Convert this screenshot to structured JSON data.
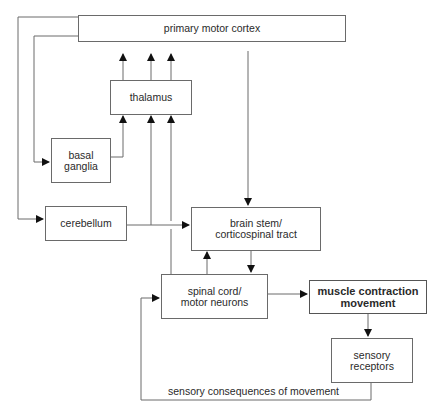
{
  "diagram": {
    "nodes": {
      "cortex": {
        "label": "primary motor cortex"
      },
      "thalamus": {
        "label": "thalamus"
      },
      "basal_ganglia": {
        "line1": "basal",
        "line2": "ganglia"
      },
      "cerebellum": {
        "label": "cerebellum"
      },
      "brainstem": {
        "line1": "brain stem/",
        "line2": "corticospinal tract"
      },
      "spinal": {
        "line1": "spinal cord/",
        "line2": "motor neurons"
      },
      "muscle": {
        "line1": "muscle contraction",
        "line2": "movement"
      },
      "sensory": {
        "line1": "sensory",
        "line2": "receptors"
      }
    },
    "edge_labels": {
      "feedback": "sensory consequences of movement"
    },
    "edges": [
      {
        "from": "cortex",
        "to": "basal_ganglia"
      },
      {
        "from": "cortex",
        "to": "cerebellum"
      },
      {
        "from": "cortex",
        "to": "brainstem"
      },
      {
        "from": "basal_ganglia",
        "to": "thalamus"
      },
      {
        "from": "cerebellum",
        "to": "thalamus"
      },
      {
        "from": "cerebellum",
        "to": "brainstem"
      },
      {
        "from": "spinal",
        "to": "thalamus"
      },
      {
        "from": "thalamus",
        "to": "cortex",
        "count": 3
      },
      {
        "from": "spinal",
        "to": "brainstem"
      },
      {
        "from": "brainstem",
        "to": "spinal"
      },
      {
        "from": "spinal",
        "to": "muscle"
      },
      {
        "from": "muscle",
        "to": "sensory"
      },
      {
        "from": "sensory",
        "to": "spinal",
        "label": "sensory consequences of movement"
      }
    ]
  }
}
